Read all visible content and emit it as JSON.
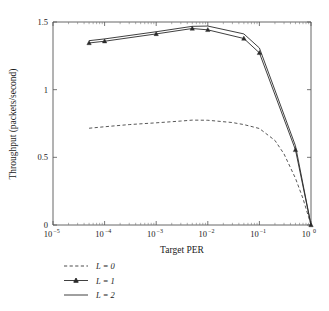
{
  "chart_data": {
    "type": "line",
    "title": "",
    "xlabel": "Target PER",
    "ylabel": "Throughput (packets/second)",
    "xscale": "log",
    "xlim": [
      1e-05,
      1
    ],
    "ylim": [
      0,
      1.5
    ],
    "grid": false,
    "legend_position": "below-left",
    "xtick_labels": [
      "10−5",
      "10−4",
      "10−3",
      "10−2",
      "10−1",
      "10⁰"
    ],
    "xtick_mantissas": [
      "10",
      "10",
      "10",
      "10",
      "10",
      "10"
    ],
    "xtick_exponents": [
      "−5",
      "−4",
      "−3",
      "−2",
      "−1",
      "0"
    ],
    "xtick_values": [
      1e-05,
      0.0001,
      0.001,
      0.01,
      0.1,
      1
    ],
    "ytick_labels": [
      "0",
      "0.5",
      "1",
      "1.5"
    ],
    "ytick_values": [
      0,
      0.5,
      1,
      1.5
    ],
    "series": [
      {
        "name": "L = 0",
        "style": "dashed",
        "marker": "none",
        "color": "#3a3a3a",
        "x": [
          5e-05,
          0.0001,
          0.0003,
          0.001,
          0.003,
          0.005,
          0.01,
          0.03,
          0.05,
          0.1,
          0.2,
          0.3,
          0.5,
          0.7,
          1.0
        ],
        "y": [
          0.715,
          0.726,
          0.742,
          0.755,
          0.768,
          0.775,
          0.774,
          0.757,
          0.742,
          0.713,
          0.625,
          0.525,
          0.345,
          0.195,
          0.0
        ]
      },
      {
        "name": "L = 1",
        "style": "solid",
        "marker": "triangle",
        "color": "#2a2a2a",
        "x": [
          5e-05,
          0.0001,
          0.001,
          0.005,
          0.01,
          0.05,
          0.1,
          0.5,
          1.0
        ],
        "y": [
          1.345,
          1.358,
          1.412,
          1.452,
          1.442,
          1.378,
          1.272,
          0.555,
          0.0
        ]
      },
      {
        "name": "L = 2",
        "style": "solid",
        "marker": "none",
        "color": "#2a2a2a",
        "x": [
          5e-05,
          0.0001,
          0.001,
          0.005,
          0.01,
          0.05,
          0.1,
          0.5,
          1.0
        ],
        "y": [
          1.362,
          1.375,
          1.428,
          1.468,
          1.47,
          1.412,
          1.308,
          0.585,
          0.0
        ]
      }
    ]
  },
  "legend": {
    "items": [
      {
        "label": "L = 0",
        "style": "dashed",
        "marker": "none"
      },
      {
        "label": "L = 1",
        "style": "solid",
        "marker": "triangle"
      },
      {
        "label": "L = 2",
        "style": "solid",
        "marker": "none"
      }
    ]
  },
  "colors": {
    "background": "#ffffff",
    "axis": "#555555",
    "line": "#2a2a2a",
    "text": "#1a1a1a"
  }
}
